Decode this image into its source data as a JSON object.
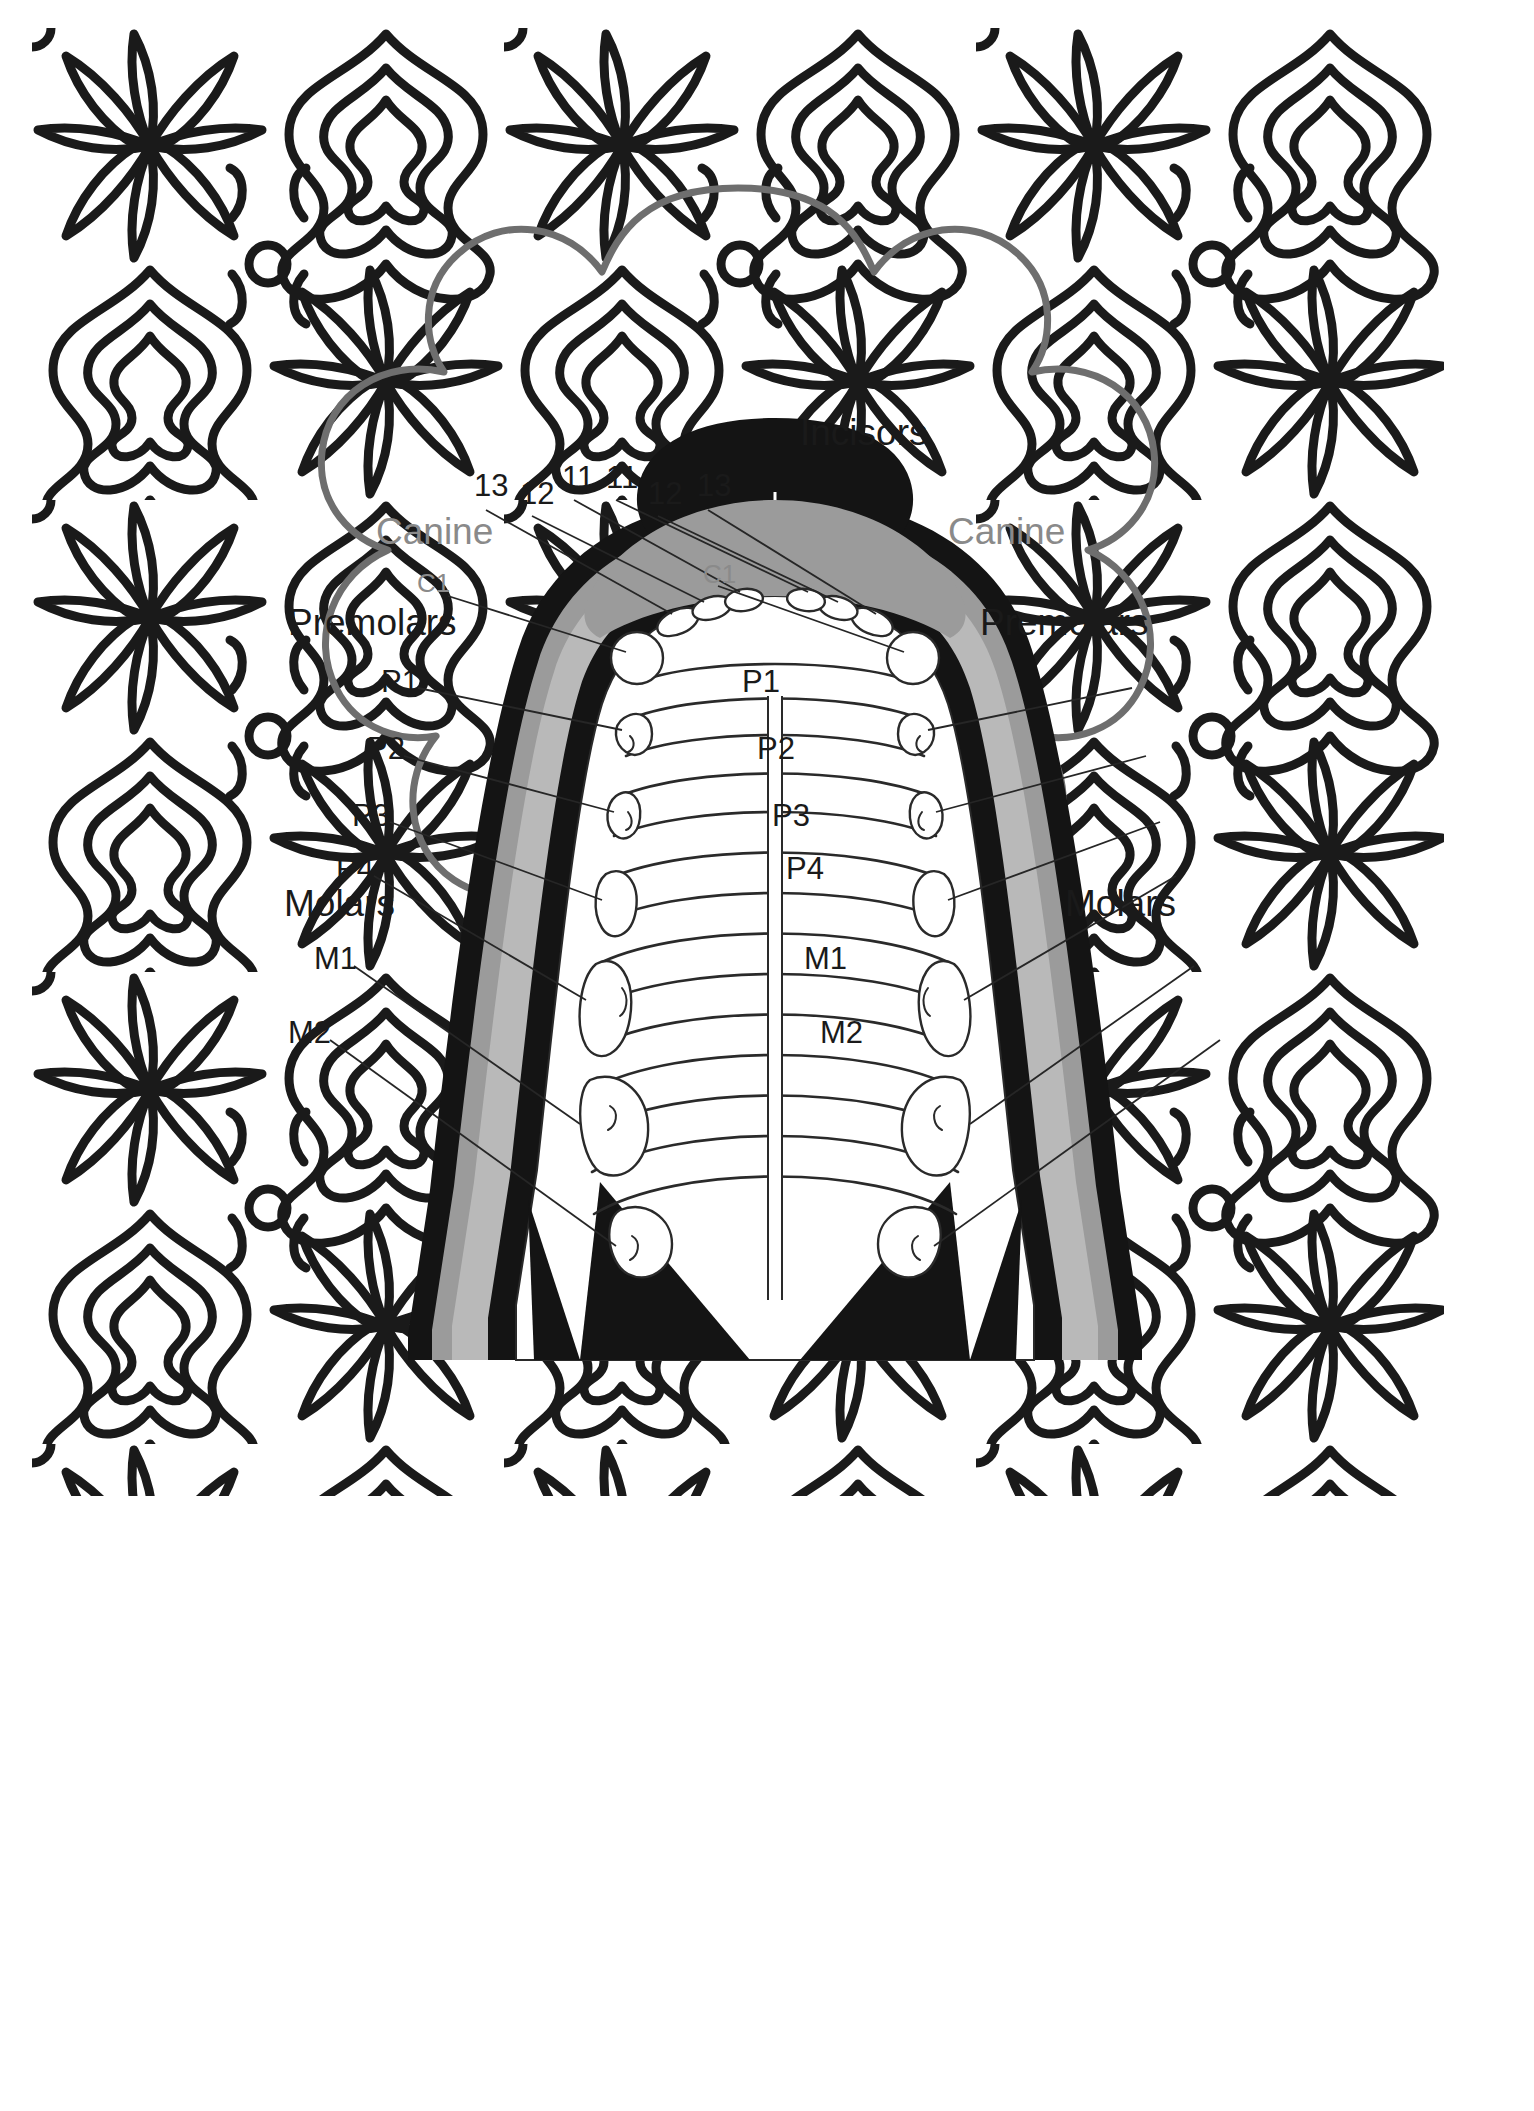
{
  "page": {
    "background_color": "#ffffff",
    "border_pattern": {
      "name": "floral-mandala-border",
      "line_color": "#1a1a1a",
      "fill_color": "#ffffff"
    },
    "vignette": {
      "name": "scalloped-frame",
      "outline_color": "#6e6e6e",
      "fill_color": "#ffffff"
    }
  },
  "diagram": {
    "name": "dog-upper-jaw-dentition",
    "view": "occlusal / ventral view of maxilla",
    "colors": {
      "black": "#141414",
      "dark_gray": "#777777",
      "mid_gray": "#9b9b9b",
      "light_gray": "#b9b9b9",
      "outline": "#2a2a2a",
      "label_black": "#1a1a1a",
      "label_gray": "#8a8a8a",
      "leader_line": "#262626"
    },
    "group_labels": [
      {
        "id": "incisors",
        "text": "Incisors",
        "color": "#1a1a1a",
        "size": "big",
        "x": 520,
        "y": 21
      },
      {
        "id": "canine-left",
        "text": "Canine",
        "color": "#8a8a8a",
        "size": "big",
        "x": 96,
        "y": 120
      },
      {
        "id": "canine-right",
        "text": "Canine",
        "color": "#8a8a8a",
        "size": "big",
        "x": 668,
        "y": 120
      },
      {
        "id": "premolars-left",
        "text": "Premolars",
        "color": "#1a1a1a",
        "size": "big",
        "x": 12,
        "y": 211
      },
      {
        "id": "premolars-right",
        "text": "Premolars",
        "color": "#1a1a1a",
        "size": "big",
        "x": 702,
        "y": 211
      },
      {
        "id": "molars-left",
        "text": "Molars",
        "color": "#1a1a1a",
        "size": "big",
        "x": 8,
        "y": 492
      },
      {
        "id": "molars-right",
        "text": "Molars",
        "color": "#1a1a1a",
        "size": "big",
        "x": 785,
        "y": 492
      }
    ],
    "tooth_labels": [
      {
        "id": "i3-left",
        "text": "13",
        "color": "#1a1a1a",
        "size": "mid",
        "x": 194,
        "y": 77
      },
      {
        "id": "i2-left",
        "text": "12",
        "color": "#1a1a1a",
        "size": "mid",
        "x": 240,
        "y": 83
      },
      {
        "id": "i1-left",
        "text": "11",
        "color": "#1a1a1a",
        "size": "mid",
        "x": 282,
        "y": 68
      },
      {
        "id": "i1-right",
        "text": "11",
        "color": "#1a1a1a",
        "size": "mid",
        "x": 326,
        "y": 68
      },
      {
        "id": "i2-right",
        "text": "12",
        "color": "#1a1a1a",
        "size": "mid",
        "x": 368,
        "y": 83
      },
      {
        "id": "i3-right",
        "text": "13",
        "color": "#1a1a1a",
        "size": "mid",
        "x": 417,
        "y": 77
      },
      {
        "id": "c1-left",
        "text": "C1",
        "color": "#8a8a8a",
        "size": "sm",
        "x": 137,
        "y": 177
      },
      {
        "id": "c1-right",
        "text": "C1",
        "color": "#8a8a8a",
        "size": "sm",
        "x": 423,
        "y": 168
      },
      {
        "id": "p1-left",
        "text": "P1",
        "color": "#1a1a1a",
        "size": "mid",
        "x": 101,
        "y": 273
      },
      {
        "id": "p2-left",
        "text": "P2",
        "color": "#1a1a1a",
        "size": "mid",
        "x": 87,
        "y": 340
      },
      {
        "id": "p3-left",
        "text": "P3",
        "color": "#1a1a1a",
        "size": "mid",
        "x": 74,
        "y": 407
      },
      {
        "id": "p4-left",
        "text": "P4",
        "color": "#1a1a1a",
        "size": "mid",
        "x": 56,
        "y": 460
      },
      {
        "id": "m1-left",
        "text": "M1",
        "color": "#1a1a1a",
        "size": "mid",
        "x": 36,
        "y": 550
      },
      {
        "id": "m2-left",
        "text": "M2",
        "color": "#1a1a1a",
        "size": "mid",
        "x": 10,
        "y": 624
      },
      {
        "id": "p1-right",
        "text": "P1",
        "color": "#1a1a1a",
        "size": "mid",
        "x": 462,
        "y": 273
      },
      {
        "id": "p2-right",
        "text": "P2",
        "color": "#1a1a1a",
        "size": "mid",
        "x": 477,
        "y": 340
      },
      {
        "id": "p3-right",
        "text": "P3",
        "color": "#1a1a1a",
        "size": "mid",
        "x": 492,
        "y": 407
      },
      {
        "id": "p4-right",
        "text": "P4",
        "color": "#1a1a1a",
        "size": "mid",
        "x": 506,
        "y": 460
      },
      {
        "id": "m1-right",
        "text": "M1",
        "color": "#1a1a1a",
        "size": "mid",
        "x": 524,
        "y": 550
      },
      {
        "id": "m2-right",
        "text": "M2",
        "color": "#1a1a1a",
        "size": "mid",
        "x": 540,
        "y": 624
      }
    ]
  }
}
